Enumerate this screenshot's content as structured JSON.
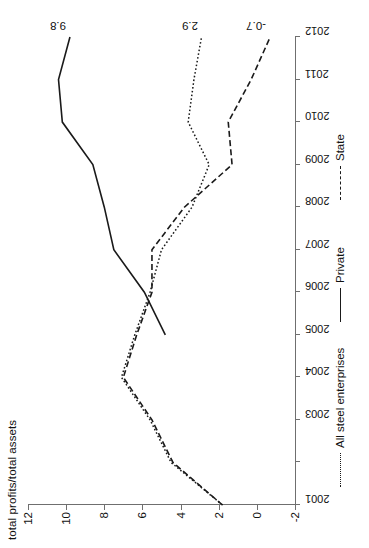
{
  "chart_data": {
    "type": "line",
    "title": "",
    "xlabel": "",
    "ylabel": "total profits/total assets",
    "x": [
      2001,
      2002,
      2003,
      2004,
      2005,
      2006,
      2007,
      2008,
      2009,
      2010,
      2011,
      2012
    ],
    "xticklabels": [
      "2001",
      "2003",
      "2004",
      "2005",
      "2006",
      "2007",
      "2008",
      "2009",
      "2010",
      "2011",
      "2012"
    ],
    "yticklabels": [
      "12",
      "10",
      "8",
      "6",
      "4",
      "2",
      "0",
      "-2"
    ],
    "ylim": [
      -2,
      12
    ],
    "yticks": [
      12,
      10,
      8,
      6,
      4,
      2,
      0,
      -2
    ],
    "xlim": [
      2001,
      2012
    ],
    "grid": false,
    "legend_position": "bottom",
    "series": [
      {
        "name": "All steel enterprises",
        "style": "dotted",
        "values": [
          1.8,
          4.5,
          5.6,
          7.1,
          6.4,
          5.6,
          5.0,
          3.4,
          2.5,
          3.6,
          3.3,
          2.9
        ],
        "end_label": "2.9"
      },
      {
        "name": "Private",
        "style": "solid",
        "values": [
          null,
          null,
          null,
          null,
          4.8,
          5.9,
          7.5,
          8.0,
          8.6,
          10.2,
          10.4,
          9.8
        ],
        "end_label": "9.8"
      },
      {
        "name": "State",
        "style": "dashed",
        "values": [
          1.8,
          4.4,
          5.5,
          7.0,
          6.3,
          5.5,
          5.5,
          3.8,
          1.3,
          1.5,
          0.3,
          -0.7
        ],
        "end_label": "-0.7"
      }
    ]
  },
  "axis": {
    "y_title": "total profits/total assets"
  },
  "legend": {
    "items": [
      {
        "label": "All steel enterprises",
        "style": "dotted"
      },
      {
        "label": "Private",
        "style": "solid"
      },
      {
        "label": "State",
        "style": "dashed"
      }
    ]
  },
  "labels": {
    "private_end": "9.8",
    "all_end": "2.9",
    "state_end": "-0.7"
  },
  "colors": {
    "line": "#1a1a1a",
    "axis": "#6f6f6f",
    "background": "#ffffff"
  }
}
